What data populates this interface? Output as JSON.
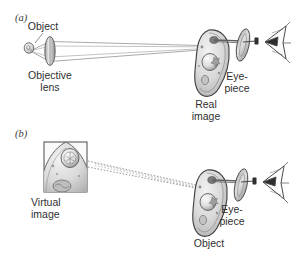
{
  "figure": {
    "background_color": "#ffffff",
    "ink_color": "#2f2f2f",
    "ray_color": "#8c8c8c",
    "specimen_fill": "#d8d8d8",
    "lens_fill": "#bcbcbc"
  },
  "panels": [
    {
      "id": "a",
      "label": "(a)",
      "annotations": {
        "object": "Object",
        "objective_lens_line1": "Objective",
        "objective_lens_line2": "lens",
        "eyepiece_line1": "Eye-",
        "eyepiece_line2": "piece",
        "real_image_line1": "Real",
        "real_image_line2": "image"
      }
    },
    {
      "id": "b",
      "label": "(b)",
      "annotations": {
        "virtual_image_line1": "Virtual",
        "virtual_image_line2": "image",
        "eyepiece_line1": "Eye-",
        "eyepiece_line2": "piece",
        "object": "Object"
      }
    }
  ]
}
